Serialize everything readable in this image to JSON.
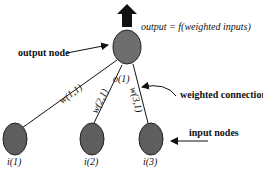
{
  "diagram": {
    "output_formula": "output = f(weighted inputs)",
    "output_node_label": "o(1)",
    "annotations": {
      "output_node": "output node",
      "weighted_connection": "weighted connection",
      "input_nodes": "input nodes"
    },
    "weights": {
      "w11": "w(1,1)",
      "w21": "w(2,1)",
      "w31": "w(3,1)"
    },
    "input_nodes": [
      {
        "label": "i(1)"
      },
      {
        "label": "i(2)"
      },
      {
        "label": "i(3)"
      }
    ],
    "colors": {
      "node_fill": "#6e6e6e",
      "line": "#111111"
    }
  }
}
